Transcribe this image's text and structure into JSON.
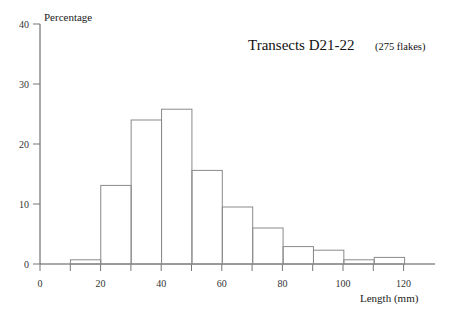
{
  "chart_data": {
    "type": "bar",
    "title": "Transects D21-22",
    "subtitle": "(275 flakes)",
    "xlabel": "Length  (mm)",
    "ylabel": "Percentage",
    "xlim": [
      0,
      130
    ],
    "ylim": [
      0,
      40
    ],
    "grid": false,
    "legend": "none",
    "bin_width": 10,
    "x_ticks": [
      "0",
      "20",
      "40",
      "60",
      "80",
      "100",
      "120"
    ],
    "x_tick_values": [
      0,
      20,
      40,
      60,
      80,
      100,
      120
    ],
    "x_minor_tick_values": [
      10,
      30,
      50,
      70,
      90,
      110
    ],
    "y_ticks": [
      "0",
      "10",
      "20",
      "30",
      "40"
    ],
    "y_tick_values": [
      0,
      10,
      20,
      30,
      40
    ],
    "bins": [
      {
        "start": 0,
        "end": 10,
        "value": 0.0
      },
      {
        "start": 10,
        "end": 20,
        "value": 0.7
      },
      {
        "start": 20,
        "end": 30,
        "value": 13.1
      },
      {
        "start": 30,
        "end": 40,
        "value": 24.0
      },
      {
        "start": 40,
        "end": 50,
        "value": 25.8
      },
      {
        "start": 50,
        "end": 60,
        "value": 15.6
      },
      {
        "start": 60,
        "end": 70,
        "value": 9.5
      },
      {
        "start": 70,
        "end": 80,
        "value": 6.0
      },
      {
        "start": 80,
        "end": 90,
        "value": 2.9
      },
      {
        "start": 90,
        "end": 100,
        "value": 2.3
      },
      {
        "start": 100,
        "end": 110,
        "value": 0.7
      },
      {
        "start": 110,
        "end": 120,
        "value": 1.1
      }
    ],
    "categories": [
      "0-10",
      "10-20",
      "20-30",
      "30-40",
      "40-50",
      "50-60",
      "60-70",
      "70-80",
      "80-90",
      "90-100",
      "100-110",
      "110-120"
    ],
    "values": [
      0.0,
      0.7,
      13.1,
      24.0,
      25.8,
      15.6,
      9.5,
      6.0,
      2.9,
      2.3,
      0.7,
      1.1
    ],
    "colors": {
      "bar_stroke": "#8a8a8a",
      "axis": "#555555",
      "text": "#1a1a1a"
    }
  }
}
